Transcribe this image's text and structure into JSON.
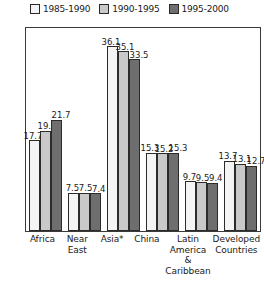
{
  "chart_data": {
    "type": "bar",
    "title": "",
    "xlabel": "",
    "ylabel": "Percent of World Births  in Each Region",
    "ylim": [
      0,
      40
    ],
    "grid": false,
    "legend_position": "top",
    "categories": [
      "Africa",
      "Near East",
      "Asia*",
      "China",
      "Latin America & Caribbean",
      "Developed Countries"
    ],
    "series": [
      {
        "name": "1985-1990",
        "color": "#f4f4f4",
        "values": [
          17.7,
          7.5,
          36.1,
          15.3,
          9.7,
          13.7
        ]
      },
      {
        "name": "1990-1995",
        "color": "#c9c9c9",
        "values": [
          19.6,
          7.5,
          35.1,
          15.2,
          9.5,
          13.1
        ]
      },
      {
        "name": "1995-2000",
        "color": "#6e6e6e",
        "values": [
          21.7,
          7.4,
          33.5,
          15.3,
          9.4,
          12.7
        ]
      }
    ]
  },
  "legend": {
    "items": [
      {
        "label": "1985-1990"
      },
      {
        "label": "1990-1995"
      },
      {
        "label": "1995-2000"
      }
    ]
  },
  "axis": {
    "y_title": "Percent of World Births  in Each Region",
    "x_ticks": [
      "Africa",
      "Near\nEast",
      "Asia*",
      "China",
      "Latin\nAmerica\n&\nCaribbean",
      "Developed\nCountries"
    ]
  }
}
